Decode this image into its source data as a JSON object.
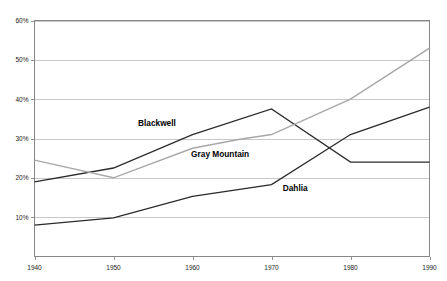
{
  "chart_data": {
    "type": "line",
    "title": "",
    "xlabel": "",
    "ylabel": "",
    "x": [
      1940,
      1950,
      1960,
      1970,
      1980,
      1990
    ],
    "xlim": [
      1940,
      1990
    ],
    "ylim": [
      0,
      60
    ],
    "yticks": [
      10,
      20,
      30,
      40,
      50,
      60
    ],
    "ytick_labels": [
      "10%",
      "20%",
      "30%",
      "40%",
      "50%",
      "60%"
    ],
    "xtick_labels": [
      "1940",
      "1950",
      "1960",
      "1970",
      "1980",
      "1990"
    ],
    "grid": "horizontal",
    "legend": "inline-labels",
    "series": [
      {
        "name": "Blackwell",
        "color": "#2b2b2b",
        "x": [
          1940,
          1950,
          1960,
          1970,
          1980,
          1990
        ],
        "values": [
          19.0,
          22.5,
          31.0,
          37.5,
          24.0,
          24.0
        ]
      },
      {
        "name": "Gray Mountain",
        "color": "#a8a8a8",
        "x": [
          1940,
          1950,
          1960,
          1966,
          1970,
          1980,
          1990
        ],
        "values": [
          24.5,
          20.0,
          27.5,
          29.8,
          31.0,
          40.0,
          53.0
        ]
      },
      {
        "name": "Dahlia",
        "color": "#2b2b2b",
        "x": [
          1940,
          1950,
          1960,
          1970,
          1980,
          1990
        ],
        "values": [
          8.0,
          9.8,
          15.3,
          18.3,
          31.0,
          38.0
        ]
      }
    ],
    "annotations": [
      {
        "text": "Blackwell",
        "x": 1955.5,
        "y": 33.2
      },
      {
        "text": "Gray Mountain",
        "x": 1963.5,
        "y": 25.3
      },
      {
        "text": "Dahlia",
        "x": 1973.0,
        "y": 16.6
      }
    ]
  },
  "axes": {
    "ytick_0": "10%",
    "ytick_1": "20%",
    "ytick_2": "30%",
    "ytick_3": "40%",
    "ytick_4": "50%",
    "ytick_5": "60%",
    "xtick_0": "1940",
    "xtick_1": "1950",
    "xtick_2": "1960",
    "xtick_3": "1970",
    "xtick_4": "1980",
    "xtick_5": "1990"
  },
  "labels": {
    "blackwell": "Blackwell",
    "gray_mountain": "Gray Mountain",
    "dahlia": "Dahlia"
  },
  "colors": {
    "series_dark": "#2b2b2b",
    "series_gray": "#a8a8a8",
    "gridline": "#b0b0b0",
    "axis": "#7a7a7a",
    "background": "#ffffff"
  }
}
